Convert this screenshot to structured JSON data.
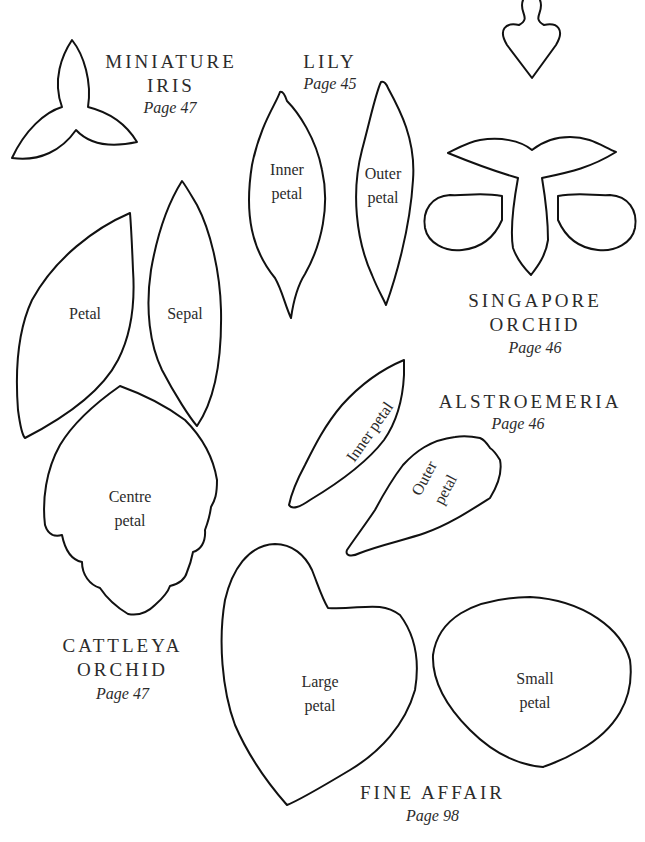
{
  "colors": {
    "background": "#ffffff",
    "outline": "#111111",
    "text": "#2b2b2b"
  },
  "templates": {
    "miniature_iris": {
      "title_line1": "MINIATURE",
      "title_line2": "IRIS",
      "page": "Page 47"
    },
    "lily": {
      "title": "LILY",
      "page": "Page 45",
      "inner_petal": [
        "Inner",
        "petal"
      ],
      "outer_petal": [
        "Outer",
        "petal"
      ]
    },
    "singapore_orchid": {
      "title_line1": "SINGAPORE",
      "title_line2": "ORCHID",
      "page": "Page 46"
    },
    "cattleya_orchid": {
      "title_line1": "CATTLEYA",
      "title_line2": "ORCHID",
      "page": "Page 47",
      "petal": "Petal",
      "sepal": "Sepal",
      "centre_petal": [
        "Centre",
        "petal"
      ]
    },
    "alstroemeria": {
      "title": "ALSTROEMERIA",
      "page": "Page 46",
      "inner_petal": "Inner petal",
      "outer_petal": [
        "Outer",
        "petal"
      ]
    },
    "fine_affair": {
      "title": "FINE AFFAIR",
      "page": "Page 98",
      "large_petal": [
        "Large",
        "petal"
      ],
      "small_petal": [
        "Small",
        "petal"
      ]
    }
  }
}
